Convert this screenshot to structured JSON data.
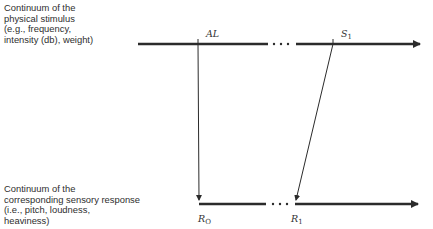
{
  "stimulus_axis": {
    "label_lines": "Continuum of the\nphysical stimulus\n(e.g., frequency,\nintensity (db), weight)",
    "points": {
      "al": {
        "main": "AL",
        "sub": ""
      },
      "s1": {
        "main": "S",
        "sub": "1"
      }
    }
  },
  "response_axis": {
    "label_lines": "Continuum of the\ncorresponding sensory response\n(i.e., pitch, loudness,\nheaviness)",
    "points": {
      "r0": {
        "main": "R",
        "sub": "O"
      },
      "r1": {
        "main": "R",
        "sub": "1"
      }
    }
  },
  "mappings": [
    {
      "from": "AL",
      "to": "R_O"
    },
    {
      "from": "S_1",
      "to": "R_1"
    }
  ],
  "colors": {
    "line": "#2b2b2b",
    "text": "#2e2e2e"
  }
}
